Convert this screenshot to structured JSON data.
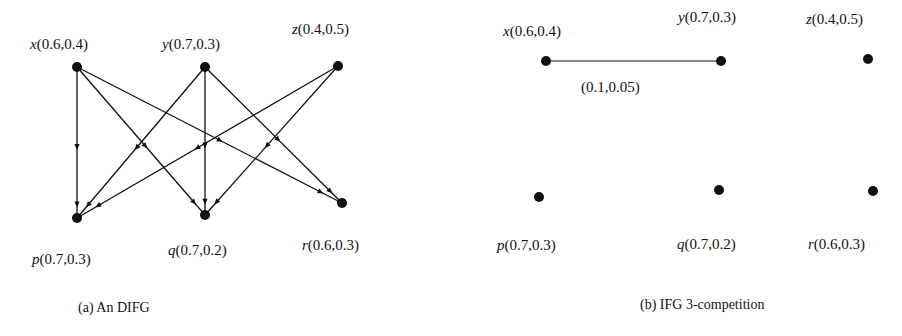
{
  "colors": {
    "ink": "#111111",
    "background": "#ffffff"
  },
  "panel_a": {
    "caption": "(a) An DIFG",
    "nodes": [
      {
        "id": "x",
        "name": "x",
        "values": "(0.6,0.4)",
        "cx": 77,
        "cy": 67,
        "lx": 30,
        "ly": 37
      },
      {
        "id": "y",
        "name": "y",
        "values": "(0.7,0.3)",
        "cx": 205,
        "cy": 67,
        "lx": 162,
        "ly": 37
      },
      {
        "id": "z",
        "name": "z",
        "values": "(0.4,0.5)",
        "cx": 338,
        "cy": 66,
        "lx": 292,
        "ly": 22
      },
      {
        "id": "p",
        "name": "p",
        "values": "(0.7,0.3)",
        "cx": 77,
        "cy": 218,
        "lx": 32,
        "ly": 252
      },
      {
        "id": "q",
        "name": "q",
        "values": "(0.7,0.2)",
        "cx": 205,
        "cy": 215,
        "lx": 168,
        "ly": 243
      },
      {
        "id": "r",
        "name": "r",
        "values": "(0.6,0.3)",
        "cx": 342,
        "cy": 203,
        "lx": 302,
        "ly": 238
      }
    ],
    "edges": [
      {
        "from": "x",
        "to": "p"
      },
      {
        "from": "x",
        "to": "q"
      },
      {
        "from": "x",
        "to": "r"
      },
      {
        "from": "y",
        "to": "p"
      },
      {
        "from": "y",
        "to": "q"
      },
      {
        "from": "y",
        "to": "r"
      },
      {
        "from": "z",
        "to": "p"
      },
      {
        "from": "z",
        "to": "q"
      }
    ]
  },
  "panel_b": {
    "caption": "(b) IFG 3-competition",
    "nodes": [
      {
        "id": "x",
        "name": "x",
        "values": "(0.6,0.4)",
        "cx": 96,
        "cy": 61,
        "lx": 53,
        "ly": 24
      },
      {
        "id": "y",
        "name": "y",
        "values": "(0.7,0.3)",
        "cx": 271,
        "cy": 61,
        "lx": 228,
        "ly": 10
      },
      {
        "id": "z",
        "name": "z",
        "values": "(0.4,0.5)",
        "cx": 418,
        "cy": 59,
        "lx": 356,
        "ly": 12
      },
      {
        "id": "p",
        "name": "p",
        "values": "(0.7,0.3)",
        "cx": 89,
        "cy": 197,
        "lx": 47,
        "ly": 238
      },
      {
        "id": "q",
        "name": "q",
        "values": "(0.7,0.2)",
        "cx": 269,
        "cy": 190,
        "lx": 227,
        "ly": 237
      },
      {
        "id": "r",
        "name": "r",
        "values": "(0.6,0.3)",
        "cx": 423,
        "cy": 191,
        "lx": 358,
        "ly": 237
      }
    ],
    "edges": [
      {
        "from": "x",
        "to": "y",
        "label": "(0.1,0.05)",
        "label_x": 131,
        "label_y": 80
      }
    ]
  }
}
